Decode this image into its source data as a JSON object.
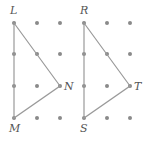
{
  "figures": [
    {
      "name": "triangle-LMN",
      "vertices": [
        {
          "label": "L",
          "x": 14,
          "y": 23,
          "lx": 10,
          "ly": 14
        },
        {
          "label": "N",
          "x": 60,
          "y": 86,
          "lx": 64,
          "ly": 90
        },
        {
          "label": "M",
          "x": 14,
          "y": 118,
          "lx": 9,
          "ly": 132
        }
      ],
      "grid": {
        "xs": [
          14,
          37,
          60
        ],
        "ys": [
          23,
          54,
          86,
          118
        ]
      }
    },
    {
      "name": "triangle-RST",
      "vertices": [
        {
          "label": "R",
          "x": 84,
          "y": 23,
          "lx": 80,
          "ly": 14
        },
        {
          "label": "T",
          "x": 130,
          "y": 86,
          "lx": 134,
          "ly": 90
        },
        {
          "label": "S",
          "x": 84,
          "y": 118,
          "lx": 80,
          "ly": 132
        }
      ],
      "grid": {
        "xs": [
          84,
          107,
          130
        ],
        "ys": [
          23,
          54,
          86,
          118
        ]
      }
    }
  ],
  "colors": {
    "dot": "#8a8a8a",
    "line": "#9a9a9a",
    "label": "#555555"
  }
}
